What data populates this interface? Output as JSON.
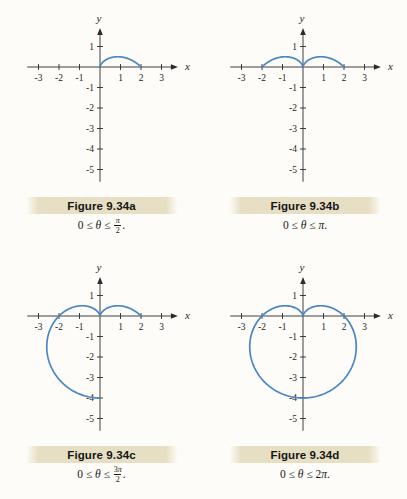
{
  "page": {
    "background": "#fdfcf8"
  },
  "colors": {
    "curve": "#4a85c4",
    "axis": "#2b2b2b",
    "tick_label": "#1f1f1f",
    "caption_band": "#e7dfc3",
    "figure_label_text": "#151515",
    "math_text": "#1a1a1a"
  },
  "figures": [
    {
      "title": "Figure 9.34a",
      "caption": {
        "prefix": "0 ≤ θ ≤ ",
        "frac": {
          "num": "π",
          "den": "2"
        },
        "suffix": "."
      }
    },
    {
      "title": "Figure 9.34b",
      "caption": {
        "prefix": "0 ≤ θ ≤ ",
        "inline": "π",
        "suffix": "."
      }
    },
    {
      "title": "Figure 9.34c",
      "caption": {
        "prefix": "0 ≤ θ ≤ ",
        "frac": {
          "num": "3π",
          "den": "2"
        },
        "suffix": "."
      }
    },
    {
      "title": "Figure 9.34d",
      "caption": {
        "prefix": "0 ≤ θ ≤ ",
        "inline": "2π",
        "suffix": "."
      }
    }
  ],
  "chart_data": [
    {
      "type": "line",
      "title": "Figure 9.34a",
      "range_label": "0 ≤ θ ≤ π/2.",
      "theta_range_pi": [
        0,
        0.5
      ],
      "polar": {
        "form": "r = a − b·sin(θ)",
        "a": 2,
        "b": 2
      },
      "points": [
        [
          2,
          0
        ],
        [
          0.87,
          0.5
        ],
        [
          0.13,
          0.23
        ],
        [
          0,
          0
        ]
      ],
      "xlabel": "x",
      "ylabel": "y",
      "xticks": [
        -3,
        -2,
        -1,
        1,
        2,
        3
      ],
      "yticks": [
        1,
        -1,
        -2,
        -3,
        -4,
        -5
      ],
      "xlim": [
        -3.55,
        3.8
      ],
      "ylim": [
        -5.6,
        1.9
      ],
      "grid": false
    },
    {
      "type": "line",
      "title": "Figure 9.34b",
      "range_label": "0 ≤ θ ≤ π.",
      "theta_range_pi": [
        0,
        1
      ],
      "polar": {
        "form": "r = a − b·sin(θ)",
        "a": 2,
        "b": 2
      },
      "points": [
        [
          2,
          0
        ],
        [
          0.87,
          0.5
        ],
        [
          0.13,
          0.23
        ],
        [
          0,
          0
        ],
        [
          -0.13,
          0.23
        ],
        [
          -0.87,
          0.5
        ],
        [
          -2,
          0
        ]
      ],
      "xlabel": "x",
      "ylabel": "y",
      "xticks": [
        -3,
        -2,
        -1,
        1,
        2,
        3
      ],
      "yticks": [
        1,
        -1,
        -2,
        -3,
        -4,
        -5
      ],
      "xlim": [
        -3.55,
        3.8
      ],
      "ylim": [
        -5.6,
        1.9
      ],
      "grid": false
    },
    {
      "type": "line",
      "title": "Figure 9.34c",
      "range_label": "0 ≤ θ ≤ 3π/2.",
      "theta_range_pi": [
        0,
        1.5
      ],
      "polar": {
        "form": "r = a − b·sin(θ)",
        "a": 2,
        "b": 2
      },
      "points": [
        [
          2,
          0
        ],
        [
          0.87,
          0.5
        ],
        [
          0.13,
          0.23
        ],
        [
          0,
          0
        ],
        [
          -0.13,
          0.23
        ],
        [
          -0.87,
          0.5
        ],
        [
          -2,
          0
        ],
        [
          -2.6,
          -1.5
        ],
        [
          -1.87,
          -3.23
        ],
        [
          0,
          -4
        ]
      ],
      "xlabel": "x",
      "ylabel": "y",
      "xticks": [
        -3,
        -2,
        -1,
        1,
        2,
        3
      ],
      "yticks": [
        1,
        -1,
        -2,
        -3,
        -4,
        -5
      ],
      "xlim": [
        -3.55,
        3.8
      ],
      "ylim": [
        -5.6,
        1.9
      ],
      "grid": false
    },
    {
      "type": "line",
      "title": "Figure 9.34d",
      "range_label": "0 ≤ θ ≤ 2π.",
      "theta_range_pi": [
        0,
        2
      ],
      "polar": {
        "form": "r = a − b·sin(θ)",
        "a": 2,
        "b": 2
      },
      "points": [
        [
          2,
          0
        ],
        [
          0.87,
          0.5
        ],
        [
          0.13,
          0.23
        ],
        [
          0,
          0
        ],
        [
          -0.13,
          0.23
        ],
        [
          -0.87,
          0.5
        ],
        [
          -2,
          0
        ],
        [
          -2.6,
          -1.5
        ],
        [
          -1.87,
          -3.23
        ],
        [
          0,
          -4
        ],
        [
          1.87,
          -3.23
        ],
        [
          2.6,
          -1.5
        ],
        [
          2,
          0
        ]
      ],
      "xlabel": "x",
      "ylabel": "y",
      "xticks": [
        -3,
        -2,
        -1,
        1,
        2,
        3
      ],
      "yticks": [
        1,
        -1,
        -2,
        -3,
        -4,
        -5
      ],
      "xlim": [
        -3.55,
        3.8
      ],
      "ylim": [
        -5.6,
        1.9
      ],
      "grid": false
    }
  ]
}
